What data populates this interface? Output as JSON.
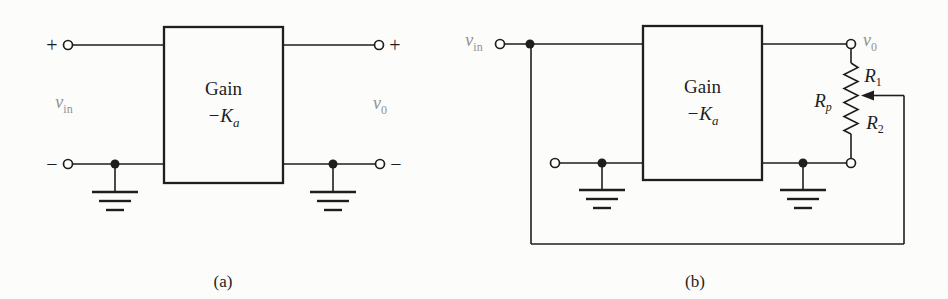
{
  "palette": {
    "background": "#fcfcfa",
    "line": "#1e1e1e",
    "muted_label": "#929292"
  },
  "circuit_a": {
    "caption": "(a)",
    "gain_label": "Gain",
    "gain_value_base": "−K",
    "gain_value_sub": "a",
    "input_label_base": "v",
    "input_label_sub": "in",
    "output_label_base": "v",
    "output_label_sub": "0",
    "input_plus": "+",
    "input_minus": "−",
    "output_plus": "+",
    "output_minus": "−"
  },
  "circuit_b": {
    "caption": "(b)",
    "gain_label": "Gain",
    "gain_value_base": "−K",
    "gain_value_sub": "a",
    "input_label_base": "v",
    "input_label_sub": "in",
    "output_label_base": "v",
    "output_label_sub": "0",
    "pot_label_base": "R",
    "pot_label_sub": "p",
    "r1_label_base": "R",
    "r1_label_sub": "1",
    "r2_label_base": "R",
    "r2_label_sub": "2"
  }
}
